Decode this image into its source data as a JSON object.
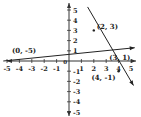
{
  "chart_data": {
    "type": "line",
    "title": "",
    "xlabel": "",
    "ylabel": "",
    "xlim": [
      -5,
      5
    ],
    "ylim": [
      -5,
      5
    ],
    "grid": false,
    "x_ticks": [
      -5,
      -4,
      -3,
      -2,
      -1,
      1,
      2,
      3,
      4,
      5
    ],
    "y_ticks": [
      5,
      4,
      3,
      2,
      1,
      -1,
      -2,
      -3,
      -4,
      -5
    ],
    "origin_label": "0",
    "series": [
      {
        "name": "steep line",
        "points": [
          [
            1.5,
            5.3
          ],
          [
            5.2,
            -2.4
          ]
        ],
        "marked_points": [
          [
            2,
            3
          ],
          [
            4,
            -1
          ]
        ]
      },
      {
        "name": "shallow line",
        "points": [
          [
            -5.3,
            0.0
          ],
          [
            5.3,
            1.3
          ]
        ]
      }
    ],
    "annotations": [
      {
        "text": "(2, 3)",
        "x": 2,
        "y": 3
      },
      {
        "text": "(3, 1)",
        "x": 3,
        "y": 1
      },
      {
        "text": "(4, -1)",
        "x": 4,
        "y": -1
      },
      {
        "text": "(0, -5)",
        "x": -4.5,
        "y": 0.5
      }
    ],
    "line_color": "#222222",
    "axis_color": "#333333"
  }
}
